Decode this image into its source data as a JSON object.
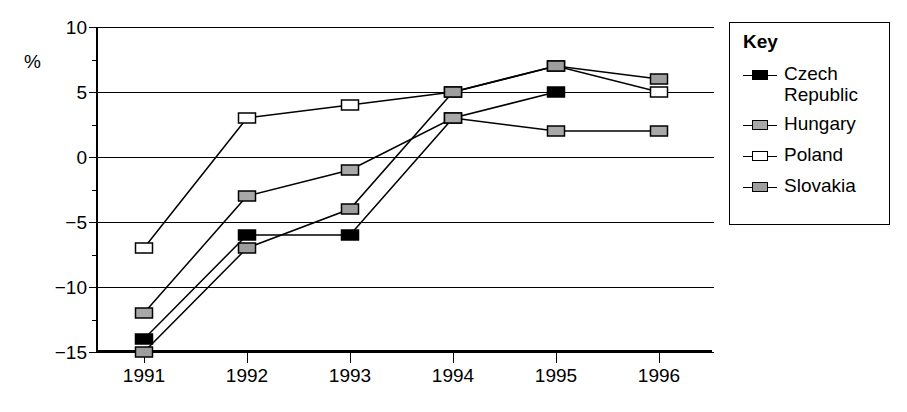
{
  "chart_data": {
    "type": "line",
    "title": "",
    "xlabel": "",
    "ylabel": "%",
    "x": [
      "1991",
      "1992",
      "1993",
      "1994",
      "1995",
      "1996"
    ],
    "categories": [
      "1991",
      "1992",
      "1993",
      "1994",
      "1995",
      "1996"
    ],
    "ylim": [
      -15,
      10
    ],
    "yticks": [
      10,
      5,
      0,
      -5,
      -10,
      -15
    ],
    "ytick_labels": [
      "10",
      "5",
      "0",
      "−5",
      "−10",
      "−15"
    ],
    "yminor_ticks": [
      7.5,
      2.5,
      -2.5,
      -7.5,
      -12.5
    ],
    "grid": "horizontal",
    "legend_position": "right-outside",
    "legend_title": "Key",
    "series": [
      {
        "name": "Czech Republic",
        "marker": "filled-square",
        "marker_fill": "#000000",
        "values": [
          -14,
          -6,
          -6,
          3,
          5,
          null
        ]
      },
      {
        "name": "Hungary",
        "marker": "gray-square",
        "marker_fill": "#a8a8a8",
        "values": [
          -12,
          -3,
          -1,
          3,
          2,
          2
        ]
      },
      {
        "name": "Poland",
        "marker": "open-square",
        "marker_fill": "#ffffff",
        "values": [
          -7,
          3,
          4,
          5,
          7,
          5
        ]
      },
      {
        "name": "Slovakia",
        "marker": "gray-square",
        "marker_fill": "#9e9e9e",
        "values": [
          -15,
          -7,
          -4,
          5,
          7,
          6
        ]
      }
    ]
  },
  "axis": {
    "unit_label": "%"
  },
  "legend": {
    "title": "Key",
    "items": [
      {
        "label": "Czech Republic"
      },
      {
        "label": "Hungary"
      },
      {
        "label": "Poland"
      },
      {
        "label": "Slovakia"
      }
    ]
  },
  "colors": {
    "axis": "#000000",
    "grid": "#000000",
    "background": "#ffffff",
    "czech_fill": "#000000",
    "hungary_fill": "#a8a8a8",
    "poland_fill": "#ffffff",
    "slovakia_fill": "#9e9e9e"
  }
}
